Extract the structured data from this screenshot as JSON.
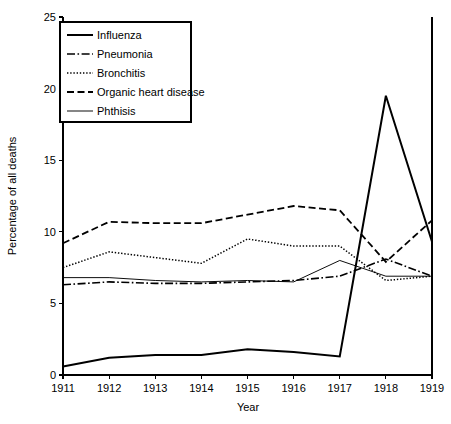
{
  "chart_data": {
    "type": "line",
    "title": "",
    "xlabel": "Year",
    "ylabel": "Percentage of all deaths",
    "categories": [
      1911,
      1912,
      1913,
      1914,
      1915,
      1916,
      1917,
      1918,
      1919
    ],
    "x": [
      1911,
      1912,
      1913,
      1914,
      1915,
      1916,
      1917,
      1918,
      1919
    ],
    "xlim": [
      1911,
      1919
    ],
    "ylim": [
      0,
      25
    ],
    "xticks": [
      "1911",
      "1912",
      "1913",
      "1914",
      "1915",
      "1916",
      "1917",
      "1918",
      "1919"
    ],
    "yticks": [
      "0",
      "5",
      "10",
      "15",
      "20",
      "25"
    ],
    "ytick_values": [
      0,
      5,
      10,
      15,
      20,
      25
    ],
    "grid": false,
    "legend_position": "upper-left",
    "series": [
      {
        "name": "Influenza",
        "style": "solid",
        "values": [
          0.6,
          1.2,
          1.4,
          1.4,
          1.8,
          1.6,
          1.3,
          19.5,
          9.3
        ]
      },
      {
        "name": "Pneumonia",
        "style": "dash-dot",
        "values": [
          6.3,
          6.5,
          6.4,
          6.4,
          6.5,
          6.6,
          6.9,
          8.1,
          6.9
        ]
      },
      {
        "name": "Bronchitis",
        "style": "dotted",
        "values": [
          7.5,
          8.6,
          8.2,
          7.8,
          9.5,
          9.0,
          9.0,
          6.6,
          6.9
        ]
      },
      {
        "name": "Organic heart disease",
        "style": "dashed",
        "values": [
          9.2,
          10.7,
          10.6,
          10.6,
          11.2,
          11.8,
          11.5,
          7.9,
          10.8
        ]
      },
      {
        "name": "Phthisis",
        "style": "thin-solid",
        "values": [
          6.8,
          6.8,
          6.6,
          6.5,
          6.6,
          6.5,
          8.0,
          6.9,
          6.9
        ]
      }
    ]
  },
  "legend": {
    "entries": [
      {
        "label": "Influenza"
      },
      {
        "label": "Pneumonia"
      },
      {
        "label": "Bronchitis"
      },
      {
        "label": "Organic heart disease"
      },
      {
        "label": "Phthisis"
      }
    ]
  },
  "colors": {
    "foreground": "#000000",
    "background": "#ffffff"
  }
}
